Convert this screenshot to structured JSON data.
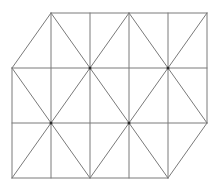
{
  "diagram": {
    "type": "triangulated-grid",
    "colors": {
      "line": "#7a7a7a",
      "node": "#2a2a2a",
      "background": "#ffffff"
    },
    "grid": {
      "x": [
        12,
        51,
        90,
        129,
        168,
        207
      ],
      "y": [
        13,
        68,
        123,
        178
      ]
    },
    "edges": [
      {
        "x1": 51,
        "y1": 13,
        "x2": 207,
        "y2": 13
      },
      {
        "x1": 12,
        "y1": 68,
        "x2": 207,
        "y2": 68
      },
      {
        "x1": 12,
        "y1": 123,
        "x2": 207,
        "y2": 123
      },
      {
        "x1": 12,
        "y1": 178,
        "x2": 168,
        "y2": 178
      },
      {
        "x1": 12,
        "y1": 68,
        "x2": 12,
        "y2": 178
      },
      {
        "x1": 51,
        "y1": 13,
        "x2": 51,
        "y2": 178
      },
      {
        "x1": 90,
        "y1": 13,
        "x2": 90,
        "y2": 178
      },
      {
        "x1": 129,
        "y1": 13,
        "x2": 129,
        "y2": 178
      },
      {
        "x1": 168,
        "y1": 13,
        "x2": 168,
        "y2": 178
      },
      {
        "x1": 207,
        "y1": 13,
        "x2": 207,
        "y2": 123
      },
      {
        "x1": 12,
        "y1": 68,
        "x2": 51,
        "y2": 13
      },
      {
        "x1": 51,
        "y1": 13,
        "x2": 90,
        "y2": 68
      },
      {
        "x1": 90,
        "y1": 68,
        "x2": 129,
        "y2": 13
      },
      {
        "x1": 129,
        "y1": 13,
        "x2": 168,
        "y2": 68
      },
      {
        "x1": 168,
        "y1": 68,
        "x2": 207,
        "y2": 13
      },
      {
        "x1": 12,
        "y1": 68,
        "x2": 51,
        "y2": 123
      },
      {
        "x1": 51,
        "y1": 123,
        "x2": 90,
        "y2": 68
      },
      {
        "x1": 90,
        "y1": 68,
        "x2": 129,
        "y2": 123
      },
      {
        "x1": 129,
        "y1": 123,
        "x2": 168,
        "y2": 68
      },
      {
        "x1": 168,
        "y1": 68,
        "x2": 207,
        "y2": 123
      },
      {
        "x1": 12,
        "y1": 178,
        "x2": 51,
        "y2": 123
      },
      {
        "x1": 51,
        "y1": 123,
        "x2": 90,
        "y2": 178
      },
      {
        "x1": 90,
        "y1": 178,
        "x2": 129,
        "y2": 123
      },
      {
        "x1": 129,
        "y1": 123,
        "x2": 168,
        "y2": 178
      },
      {
        "x1": 168,
        "y1": 178,
        "x2": 207,
        "y2": 123
      }
    ],
    "nodes": [
      {
        "x": 90,
        "y": 68,
        "r": 1.5
      },
      {
        "x": 168,
        "y": 68,
        "r": 1.5
      },
      {
        "x": 51,
        "y": 123,
        "r": 1.5
      },
      {
        "x": 129,
        "y": 123,
        "r": 1.5
      }
    ]
  }
}
